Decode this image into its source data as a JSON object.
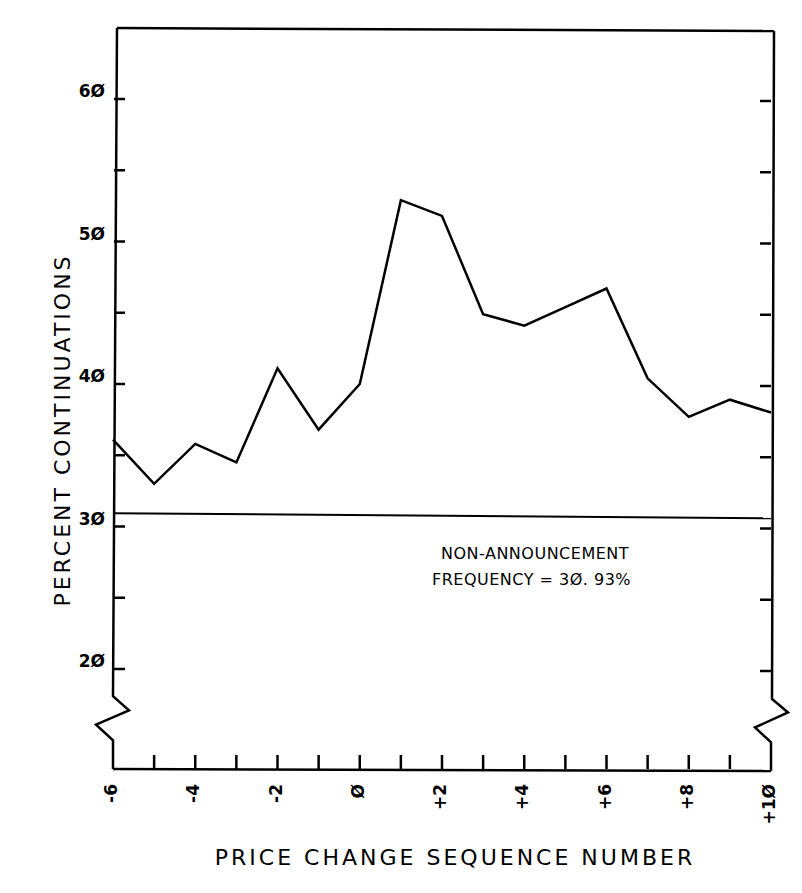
{
  "chart_data": {
    "type": "line",
    "title": "",
    "xlabel": "PRICE CHANGE SEQUENCE NUMBER",
    "ylabel": "PERCENT CONTINUATIONS",
    "x": [
      -6,
      -5,
      -4,
      -3,
      -2,
      -1,
      0,
      1,
      2,
      3,
      4,
      5,
      6,
      7,
      8,
      9,
      10
    ],
    "series": [
      {
        "name": "Percent continuations",
        "values": [
          36.1,
          33.0,
          35.8,
          34.5,
          41.1,
          36.8,
          40.0,
          52.9,
          51.8,
          44.9,
          44.1,
          45.4,
          46.7,
          40.4,
          37.7,
          38.9,
          38.0
        ]
      }
    ],
    "reference_line": {
      "value": 30.93,
      "label": "NON-ANNOUNCEMENT FREQUENCY = 30.93%"
    },
    "xticks": [
      -6,
      -5,
      -4,
      -3,
      -2,
      -1,
      0,
      1,
      2,
      3,
      4,
      5,
      6,
      7,
      8,
      9,
      10
    ],
    "xtick_labels": [
      "-6",
      "-4",
      "-2",
      "Ø",
      "+2",
      "+4",
      "+6",
      "+8",
      "+1Ø"
    ],
    "xtick_label_values": [
      -6,
      -4,
      -2,
      0,
      2,
      4,
      6,
      8,
      10
    ],
    "yticks": [
      20,
      25,
      30,
      35,
      40,
      45,
      50,
      55,
      60
    ],
    "ytick_labels": [
      "2Ø",
      "3Ø",
      "4Ø",
      "5Ø",
      "6Ø"
    ],
    "ytick_label_values": [
      20,
      30,
      40,
      50,
      60
    ],
    "xlim": [
      -6,
      10
    ],
    "ylim": [
      15,
      65
    ],
    "axis_break": true,
    "grid": false,
    "legend": null
  },
  "annotation": {
    "line1": "NON-ANNOUNCEMENT",
    "line2": "FREQUENCY = 3Ø. 93%"
  },
  "axes": {
    "x_title": "PRICE CHANGE SEQUENCE NUMBER",
    "y_title": "PERCENT CONTINUATIONS"
  }
}
